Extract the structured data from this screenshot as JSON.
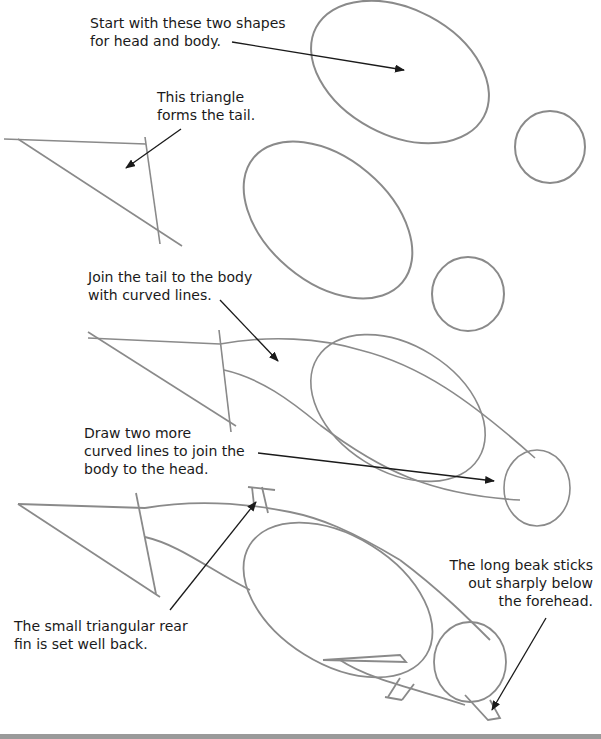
{
  "captions": {
    "step1": "Start with these two shapes\nfor head and body.",
    "step2": "This triangle\nforms the tail.",
    "step3": "Join the tail to the body\nwith curved lines.",
    "step4": "Draw two more\ncurved lines to join the\nbody to the head.",
    "step5_fin": "The small triangular rear\nfin is set well back.",
    "step5_beak": "The long beak sticks\nout sharply below\nthe forehead."
  },
  "colors": {
    "pencil": "#8a8a8a",
    "ink": "#1a1a1a",
    "background": "#ffffff",
    "strip": "#9a9a9a"
  }
}
